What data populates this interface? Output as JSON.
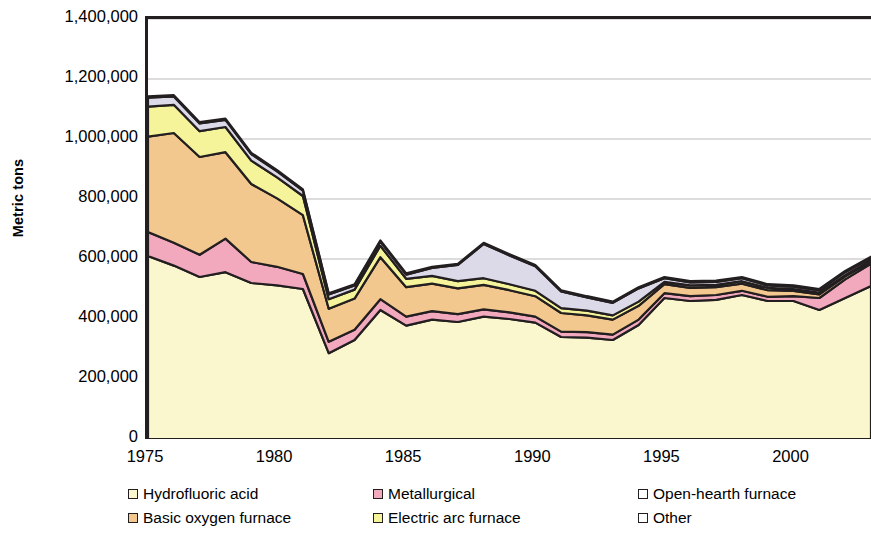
{
  "chart_data": {
    "type": "area",
    "stacked": true,
    "title": "",
    "subtitle": "",
    "xlabel": "",
    "ylabel": "Metric tons",
    "xlim": [
      1975,
      2003
    ],
    "ylim": [
      0,
      1400000
    ],
    "grid": true,
    "grid_axis": "y",
    "legend_position": "bottom",
    "y_ticks": [
      "0",
      "200,000",
      "400,000",
      "600,000",
      "800,000",
      "1,000,000",
      "1,200,000",
      "1,400,000"
    ],
    "y_tick_values": [
      0,
      200000,
      400000,
      600000,
      800000,
      1000000,
      1200000,
      1400000
    ],
    "x_ticks": [
      "1975",
      "1980",
      "1985",
      "1990",
      "1995",
      "2000"
    ],
    "x_tick_values": [
      1975,
      1980,
      1985,
      1990,
      1995,
      2000
    ],
    "x": [
      1975,
      1976,
      1977,
      1978,
      1979,
      1980,
      1981,
      1982,
      1983,
      1984,
      1985,
      1986,
      1987,
      1988,
      1989,
      1990,
      1991,
      1992,
      1993,
      1994,
      1995,
      1996,
      1997,
      1998,
      1999,
      2000,
      2001,
      2002,
      2003
    ],
    "series": [
      {
        "name": "Hydrofluoric acid",
        "color": "#FAF7CE",
        "values": [
          610000,
          578000,
          540000,
          556000,
          520000,
          512000,
          500000,
          286000,
          330000,
          430000,
          378000,
          398000,
          390000,
          408000,
          400000,
          388000,
          340000,
          338000,
          330000,
          380000,
          470000,
          460000,
          464000,
          480000,
          460000,
          460000,
          430000,
          470000,
          510000
        ]
      },
      {
        "name": "Metallurgical",
        "color": "#F2A9BE",
        "values": [
          80000,
          76000,
          74000,
          112000,
          70000,
          62000,
          50000,
          38000,
          34000,
          36000,
          30000,
          28000,
          26000,
          24000,
          22000,
          20000,
          18000,
          18000,
          18000,
          18000,
          16000,
          16000,
          16000,
          14000,
          14000,
          16000,
          40000,
          62000,
          74000
        ]
      },
      {
        "name": "Basic oxygen furnace",
        "color": "#F3C88E",
        "values": [
          318000,
          366000,
          326000,
          288000,
          260000,
          228000,
          196000,
          110000,
          104000,
          140000,
          98000,
          92000,
          86000,
          82000,
          74000,
          68000,
          62000,
          56000,
          50000,
          46000,
          30000,
          28000,
          26000,
          24000,
          22000,
          18000,
          12000,
          10000,
          8000
        ]
      },
      {
        "name": "Electric arc furnace",
        "color": "#F6F49A",
        "values": [
          100000,
          94000,
          86000,
          84000,
          78000,
          70000,
          64000,
          32000,
          30000,
          38000,
          28000,
          26000,
          24000,
          22000,
          20000,
          18000,
          16000,
          16000,
          14000,
          14000,
          8000,
          8000,
          8000,
          8000,
          8000,
          6000,
          6000,
          4000,
          4000
        ],
        "short_name": "Electric arc furnace"
      },
      {
        "name": "Open-hearth furnace",
        "color": "#DCD9E9",
        "values": [
          30000,
          28000,
          26000,
          24000,
          22000,
          20000,
          18000,
          16000,
          14000,
          14000,
          14000,
          26000,
          54000,
          114000,
          96000,
          82000,
          56000,
          44000,
          42000,
          44000,
          12000,
          10000,
          10000,
          10000,
          8000,
          8000,
          8000,
          10000,
          8000
        ]
      },
      {
        "name": "Other",
        "color": "#FFFFFF",
        "values": [
          4000,
          4000,
          4000,
          4000,
          4000,
          4000,
          4000,
          4000,
          4000,
          4000,
          4000,
          4000,
          4000,
          4000,
          4000,
          4000,
          4000,
          4000,
          4000,
          4000,
          4000,
          4000,
          4000,
          4000,
          4000,
          4000,
          4000,
          4000,
          4000
        ]
      }
    ]
  },
  "axes": {
    "y_title": "Metric tons"
  },
  "legend": {
    "items": [
      {
        "label": "Hydrofluoric acid",
        "color": "#FAF7CE",
        "col": 0,
        "row": 0
      },
      {
        "label": "Basic oxygen furnace",
        "color": "#F3C88E",
        "col": 0,
        "row": 1
      },
      {
        "label": "Metallurgical",
        "color": "#F2A9BE",
        "col": 1,
        "row": 0
      },
      {
        "label": "Electric arc furnace",
        "color": "#F6F49A",
        "col": 1,
        "row": 1
      },
      {
        "label": "Open-hearth furnace",
        "color": "#FFFFFF",
        "col": 2,
        "row": 0
      },
      {
        "label": "Other",
        "color": "#FFFFFF",
        "col": 2,
        "row": 1
      }
    ]
  },
  "style": {
    "outline_color": "#231f20",
    "grid_color": "#b9b9b9",
    "plot_bg": "#ffffff"
  }
}
